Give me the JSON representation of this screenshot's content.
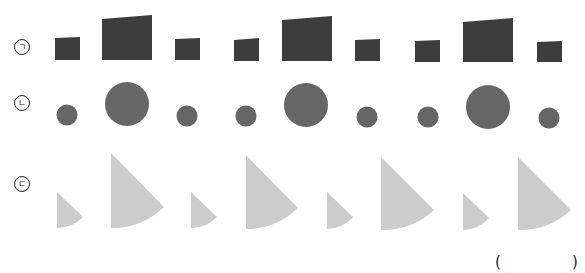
{
  "labels": {
    "row1": "ㄱ",
    "row2": "ㄴ",
    "row3": "ㄷ"
  },
  "answer_blank": {
    "open": "(",
    "close": ")"
  },
  "colors": {
    "row1_fill": "#3d3d3d",
    "row2_fill": "#666666",
    "row3_fill": "#cccccc"
  },
  "rows": [
    {
      "name": "trapezoids",
      "shapes": [
        {
          "size": "small"
        },
        {
          "size": "large"
        },
        {
          "size": "small"
        },
        {
          "size": "small"
        },
        {
          "size": "large"
        },
        {
          "size": "small"
        },
        {
          "size": "small"
        },
        {
          "size": "large"
        },
        {
          "size": "small"
        }
      ]
    },
    {
      "name": "dodecagons",
      "shapes": [
        {
          "size": "small"
        },
        {
          "size": "large"
        },
        {
          "size": "small"
        },
        {
          "size": "small"
        },
        {
          "size": "large"
        },
        {
          "size": "small"
        },
        {
          "size": "small"
        },
        {
          "size": "large"
        },
        {
          "size": "small"
        }
      ]
    },
    {
      "name": "sectors",
      "shapes": [
        {
          "size": "small"
        },
        {
          "size": "large"
        },
        {
          "size": "small"
        },
        {
          "size": "large"
        },
        {
          "size": "small"
        },
        {
          "size": "large"
        },
        {
          "size": "small"
        },
        {
          "size": "large"
        }
      ]
    }
  ]
}
